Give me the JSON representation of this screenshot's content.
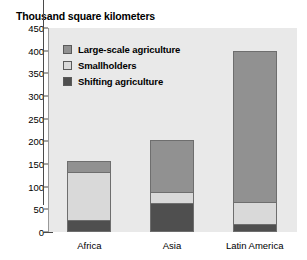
{
  "chart_data": {
    "type": "bar",
    "title": "Thousand square kilometers",
    "xlabel": "",
    "ylabel": "Thousand square kilometers",
    "ylim": [
      0,
      450
    ],
    "ytick_step": 50,
    "yticks": [
      450,
      400,
      350,
      300,
      250,
      200,
      150,
      100,
      50,
      0
    ],
    "grid": false,
    "stacked": true,
    "legend_position": "upper-left-inside",
    "categories": [
      "Africa",
      "Asia",
      "Latin America"
    ],
    "series": [
      {
        "name": "Large-scale agriculture",
        "color": "#919191",
        "values": [
          21,
          115,
          335
        ]
      },
      {
        "name": "Smallholders",
        "color": "#d9d9d9",
        "values": [
          113,
          29,
          52
        ]
      },
      {
        "name": "Shifting agriculture",
        "color": "#4f4f4f",
        "values": [
          22,
          60,
          13
        ]
      }
    ],
    "totals": [
      156,
      204,
      400
    ]
  },
  "legend": {
    "items": [
      {
        "label": "Large-scale agriculture",
        "swatch": "#919191"
      },
      {
        "label": "Smallholders",
        "swatch": "#d9d9d9"
      },
      {
        "label": "Shifting agriculture",
        "swatch": "#4f4f4f"
      }
    ]
  },
  "axis": {
    "y_labels": [
      "450",
      "400",
      "350",
      "300",
      "250",
      "200",
      "150",
      "100",
      "50",
      "0"
    ],
    "x_labels": [
      "Africa",
      "Asia",
      "Latin America"
    ]
  },
  "colors": {
    "plot_background": "#e9e9e9",
    "page_background": "#ffffff",
    "axis": "#4a4a4a",
    "bar_outline": "#6e6e6e",
    "text": "#000000"
  }
}
